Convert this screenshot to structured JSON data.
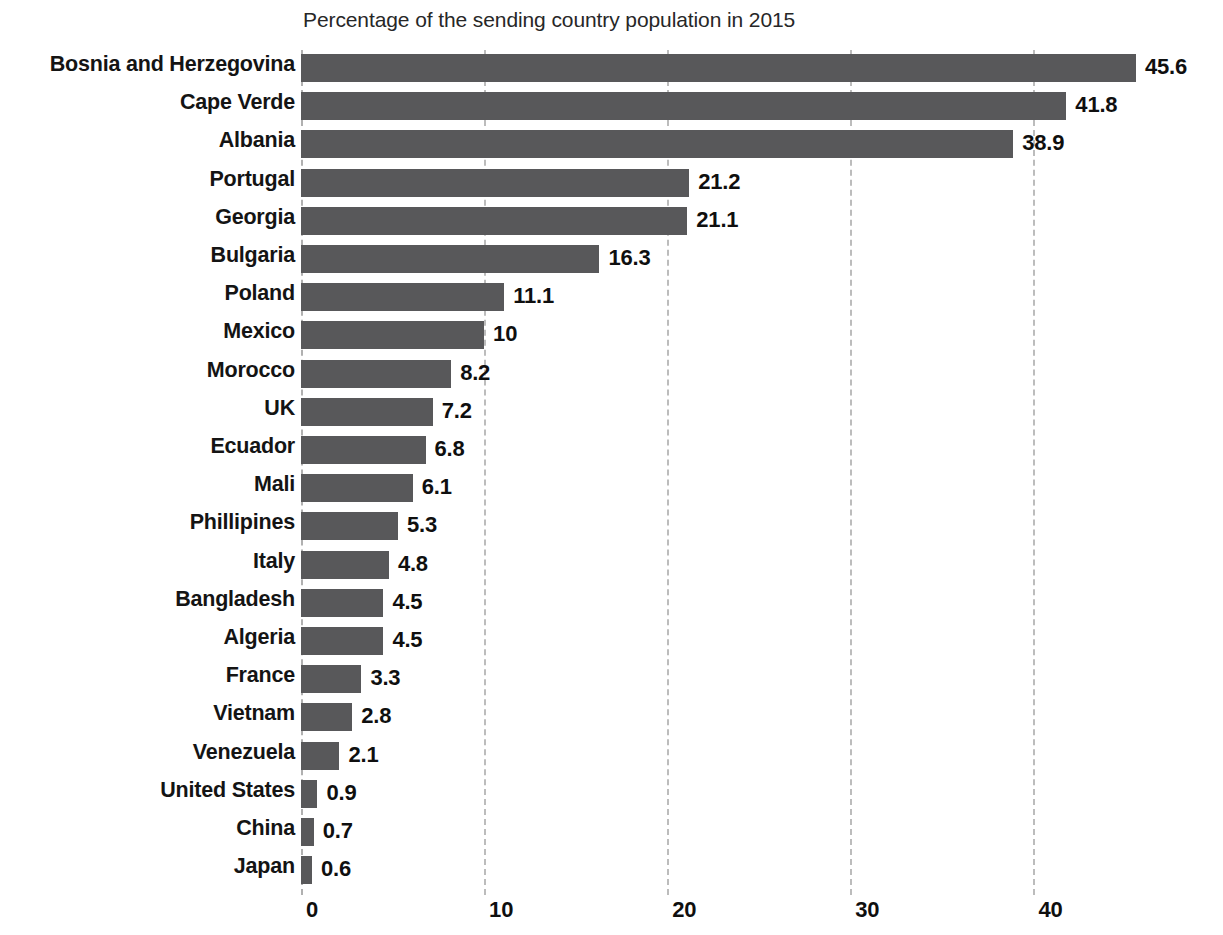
{
  "chart_data": {
    "type": "bar",
    "orientation": "horizontal",
    "title": "",
    "subtitle": "Percentage of the sending country population in 2015",
    "xlabel": "",
    "ylabel": "",
    "xlim": [
      0,
      46
    ],
    "xticks": [
      "0",
      "10",
      "20",
      "30",
      "40"
    ],
    "xtick_values": [
      0,
      10,
      20,
      30,
      40
    ],
    "grid": true,
    "grid_style": "dashed-vertical",
    "legend": "none",
    "bar_color": "#58585a",
    "grid_color": "#bcbcbc",
    "background_color": "#ffffff",
    "text_color": "#141414",
    "categories": [
      "Bosnia and Herzegovina",
      "Cape Verde",
      "Albania",
      "Portugal",
      "Georgia",
      "Bulgaria",
      "Poland",
      "Mexico",
      "Morocco",
      "UK",
      "Ecuador",
      "Mali",
      "Phillipines",
      "Italy",
      "Bangladesh",
      "Algeria",
      "France",
      "Vietnam",
      "Venezuela",
      "United States",
      "China",
      "Japan"
    ],
    "values": [
      45.6,
      41.8,
      38.9,
      21.2,
      21.1,
      16.3,
      11.1,
      10,
      8.2,
      7.2,
      6.8,
      6.1,
      5.3,
      4.8,
      4.5,
      4.5,
      3.3,
      2.8,
      2.1,
      0.9,
      0.7,
      0.6
    ],
    "value_labels": [
      "45.6",
      "41.8",
      "38.9",
      "21.2",
      "21.1",
      "16.3",
      "11.1",
      "10",
      "8.2",
      "7.2",
      "6.8",
      "6.1",
      "5.3",
      "4.8",
      "4.5",
      "4.5",
      "3.3",
      "2.8",
      "2.1",
      "0.9",
      "0.7",
      "0.6"
    ]
  }
}
